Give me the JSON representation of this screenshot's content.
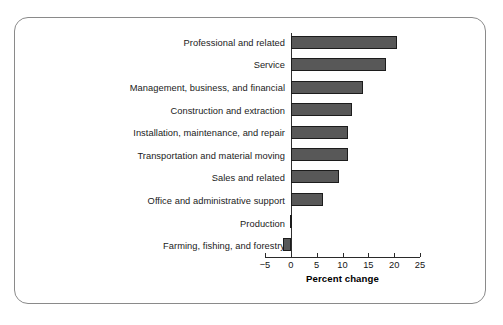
{
  "chart_data": {
    "type": "bar",
    "orientation": "horizontal",
    "title": "",
    "xlabel": "Percent change",
    "ylabel": "",
    "xlim": [
      -5,
      25
    ],
    "xticks": [
      -5,
      0,
      5,
      10,
      15,
      20,
      25
    ],
    "xtick_labels": [
      "−5",
      "0",
      "5",
      "10",
      "15",
      "20",
      "25"
    ],
    "grid": false,
    "legend": null,
    "bar_color": "#585858",
    "bar_edge_color": "#1c1c1c",
    "categories": [
      "Professional and related",
      "Service",
      "Management, business, and financial",
      "Construction and extraction",
      "Installation, maintenance, and repair",
      "Transportation and material moving",
      "Sales and related",
      "Office and administrative support",
      "Production",
      "Farming, fishing, and forestry"
    ],
    "values": [
      20.6,
      18.4,
      14.0,
      11.8,
      11.0,
      11.0,
      9.4,
      6.2,
      -0.2,
      -1.5
    ]
  },
  "frame": {
    "border_color": "#8a8a8a"
  }
}
